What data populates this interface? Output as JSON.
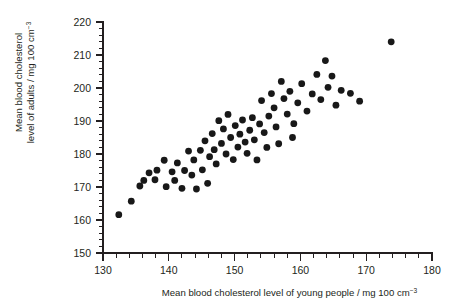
{
  "chart_data": {
    "type": "scatter",
    "title": "",
    "xlabel": "Mean blood cholesterol level of young people / mg 100 cm-3",
    "ylabel": "Mean blood cholesterol level of adults / mg 100 cm-3",
    "xlabel_main": "Mean blood cholesterol level of young people / mg 100 cm",
    "xlabel_sup": "−3",
    "ylabel_line1": "Mean blood cholesterol",
    "ylabel_line2_main": "level of adults / mg 100 cm",
    "ylabel_line2_sup": "−3",
    "xlim": [
      130,
      180
    ],
    "ylim": [
      150,
      220
    ],
    "x_major_ticks": [
      130,
      140,
      150,
      160,
      170,
      180
    ],
    "x_tick_labels": [
      "130",
      "140",
      "150",
      "160",
      "170",
      "180"
    ],
    "x_minor_step": 2,
    "y_major_ticks": [
      150,
      160,
      170,
      180,
      190,
      200,
      210,
      220
    ],
    "y_tick_labels": [
      "150",
      "160",
      "170",
      "180",
      "190",
      "200",
      "210",
      "220"
    ],
    "y_minor_step": 2,
    "grid": false,
    "legend": false,
    "marker": "filled-circle",
    "marker_color": "#181818",
    "marker_radius_px": 3.4,
    "point_count": 72,
    "points": [
      [
        132.4,
        161.6
      ],
      [
        134.3,
        165.7
      ],
      [
        135.6,
        170.3
      ],
      [
        137.0,
        174.3
      ],
      [
        137.9,
        172.2
      ],
      [
        138.2,
        175.1
      ],
      [
        136.2,
        172.0
      ],
      [
        139.3,
        178.1
      ],
      [
        139.6,
        170.1
      ],
      [
        140.5,
        174.6
      ],
      [
        140.9,
        172.0
      ],
      [
        141.3,
        177.3
      ],
      [
        142.0,
        169.6
      ],
      [
        142.4,
        175.0
      ],
      [
        143.0,
        180.9
      ],
      [
        143.5,
        173.6
      ],
      [
        143.8,
        178.2
      ],
      [
        144.2,
        169.4
      ],
      [
        144.8,
        181.1
      ],
      [
        145.1,
        175.2
      ],
      [
        145.5,
        184.0
      ],
      [
        145.9,
        171.1
      ],
      [
        146.2,
        179.2
      ],
      [
        146.6,
        186.2
      ],
      [
        146.9,
        181.3
      ],
      [
        147.2,
        177.0
      ],
      [
        147.6,
        190.1
      ],
      [
        148.0,
        183.2
      ],
      [
        148.3,
        187.6
      ],
      [
        148.7,
        180.0
      ],
      [
        149.0,
        192.0
      ],
      [
        149.4,
        185.0
      ],
      [
        149.8,
        178.3
      ],
      [
        150.1,
        188.6
      ],
      [
        150.5,
        182.1
      ],
      [
        150.8,
        186.0
      ],
      [
        151.2,
        190.3
      ],
      [
        151.6,
        183.6
      ],
      [
        151.9,
        180.2
      ],
      [
        152.3,
        187.2
      ],
      [
        152.7,
        191.0
      ],
      [
        153.0,
        184.3
      ],
      [
        153.4,
        178.2
      ],
      [
        153.8,
        189.1
      ],
      [
        154.1,
        196.2
      ],
      [
        154.5,
        186.5
      ],
      [
        154.9,
        182.0
      ],
      [
        155.2,
        191.5
      ],
      [
        155.6,
        198.3
      ],
      [
        156.0,
        194.0
      ],
      [
        156.3,
        188.2
      ],
      [
        156.7,
        183.1
      ],
      [
        157.1,
        202.0
      ],
      [
        157.5,
        196.8
      ],
      [
        158.0,
        192.1
      ],
      [
        158.4,
        199.0
      ],
      [
        159.0,
        189.2
      ],
      [
        159.6,
        195.5
      ],
      [
        160.2,
        201.3
      ],
      [
        161.0,
        193.0
      ],
      [
        161.8,
        198.2
      ],
      [
        162.5,
        204.1
      ],
      [
        163.1,
        196.5
      ],
      [
        163.8,
        208.3
      ],
      [
        164.2,
        200.2
      ],
      [
        164.8,
        203.6
      ],
      [
        165.4,
        194.8
      ],
      [
        166.2,
        199.3
      ],
      [
        167.6,
        198.4
      ],
      [
        169.0,
        196.0
      ],
      [
        173.8,
        214.0
      ],
      [
        158.8,
        185.0
      ]
    ]
  },
  "axes": {
    "x_axis_name": "x-axis",
    "y_axis_name": "y-axis"
  }
}
